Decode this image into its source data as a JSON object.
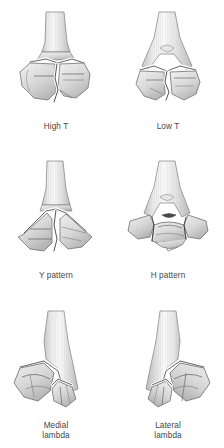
{
  "figure": {
    "background_color": "#ffffff",
    "caption_color": "#454545",
    "bone_colors": {
      "outline": "#6e6e6e",
      "fill_light": "#f2f2f2",
      "fill_mid": "#d8d8d8",
      "fill_dark": "#b4b4b4",
      "fracture_line": "#3a3a3a",
      "fracture_gap": "#ffffff"
    },
    "columns": 2,
    "rows": 3,
    "panels": [
      {
        "id": "high-t",
        "label": "High T",
        "row": 1,
        "column": 1,
        "description": "Transverse supracondylar fracture high above the joint with vertical intercondylar split"
      },
      {
        "id": "low-t",
        "label": "Low T",
        "row": 1,
        "column": 2,
        "description": "Transverse fracture close to the joint line with vertical intercondylar split"
      },
      {
        "id": "y-pattern",
        "label": "Y pattern",
        "row": 2,
        "column": 1,
        "description": "Two oblique column fractures converging upward into the shaft forming a Y"
      },
      {
        "id": "h-pattern",
        "label": "H pattern",
        "row": 2,
        "column": 2,
        "description": "Both columns fractured with a free central trochlear fragment"
      },
      {
        "id": "medial-lambda",
        "label": "Medial\nlambda",
        "row": 3,
        "column": 1,
        "description": "Oblique fracture exiting medially leaving a separate distal fragment"
      },
      {
        "id": "lateral-lambda",
        "label": "Lateral\nlambda",
        "row": 3,
        "column": 2,
        "description": "Oblique fracture exiting laterally leaving a separate distal fragment"
      }
    ]
  }
}
